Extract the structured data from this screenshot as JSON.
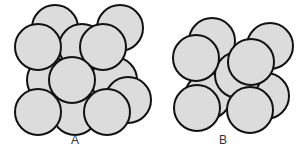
{
  "figure": {
    "style": {
      "sphere_fill": "#dcdcdc",
      "sphere_stroke": "#111111",
      "background": "#ffffff",
      "sphere_radius": 23
    },
    "panels": [
      {
        "label": "A",
        "spheres": [
          {
            "layer": "back",
            "cx": 55,
            "cy": 28
          },
          {
            "layer": "back",
            "cx": 120,
            "cy": 28
          },
          {
            "layer": "back",
            "cx": 50,
            "cy": 80
          },
          {
            "layer": "back",
            "cx": 114,
            "cy": 80
          },
          {
            "layer": "back",
            "cx": 128,
            "cy": 100
          },
          {
            "layer": "back",
            "cx": 75,
            "cy": 112
          },
          {
            "layer": "middle",
            "cx": 82,
            "cy": 47
          },
          {
            "layer": "front",
            "cx": 38,
            "cy": 47
          },
          {
            "layer": "front",
            "cx": 103,
            "cy": 47
          },
          {
            "layer": "front",
            "cx": 72,
            "cy": 80
          },
          {
            "layer": "front",
            "cx": 38,
            "cy": 112
          },
          {
            "layer": "front",
            "cx": 107,
            "cy": 112
          }
        ]
      },
      {
        "label": "B",
        "spheres": [
          {
            "layer": "back",
            "cx": 212,
            "cy": 41
          },
          {
            "layer": "back",
            "cx": 270,
            "cy": 46
          },
          {
            "layer": "back",
            "cx": 208,
            "cy": 96
          },
          {
            "layer": "back",
            "cx": 266,
            "cy": 96
          },
          {
            "layer": "middle",
            "cx": 238,
            "cy": 75
          },
          {
            "layer": "front",
            "cx": 196,
            "cy": 58
          },
          {
            "layer": "front",
            "cx": 251,
            "cy": 62
          },
          {
            "layer": "front",
            "cx": 197,
            "cy": 108
          },
          {
            "layer": "front",
            "cx": 250,
            "cy": 110
          }
        ]
      }
    ]
  }
}
